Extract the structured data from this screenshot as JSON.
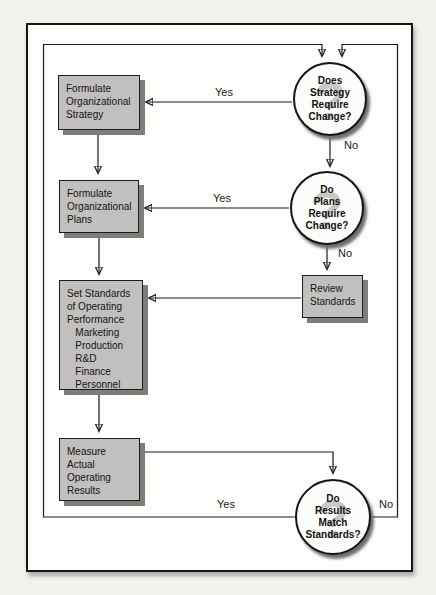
{
  "diagram": {
    "watermark": "?",
    "boxes": {
      "formulate_strategy": {
        "lines": [
          "Formulate",
          "Organizational",
          "Strategy"
        ]
      },
      "formulate_plans": {
        "lines": [
          "Formulate",
          "Organizational",
          "Plans"
        ]
      },
      "set_standards": {
        "lines": [
          "Set Standards",
          "of Operating",
          "Performance",
          "   Marketing",
          "   Production",
          "   R&D",
          "   Finance",
          "   Personnel"
        ]
      },
      "measure_results": {
        "lines": [
          "Measure",
          "Actual",
          "Operating",
          "Results"
        ]
      },
      "review_standards": {
        "lines": [
          "Review",
          "Standards"
        ]
      }
    },
    "decisions": {
      "strategy_change": {
        "lines": [
          "Does",
          "Strategy",
          "Require",
          "Change?"
        ]
      },
      "plans_change": {
        "lines": [
          "Do",
          "Plans",
          "Require",
          "Change?"
        ]
      },
      "results_match": {
        "lines": [
          "Do",
          "Results",
          "Match",
          "Standards?"
        ]
      }
    },
    "labels": {
      "strategy_yes": "Yes",
      "strategy_no": "No",
      "plans_yes": "Yes",
      "plans_no": "No",
      "results_yes": "Yes",
      "results_no": "No"
    },
    "colors": {
      "box_fill": "#c1c0be",
      "box_shadow": "#7e7d7a",
      "circle_fill": "#fcfcfb",
      "line": "#1b1b1b",
      "watermark_gray": "#c8c7c4",
      "page_background": "#f2f1ee"
    }
  }
}
